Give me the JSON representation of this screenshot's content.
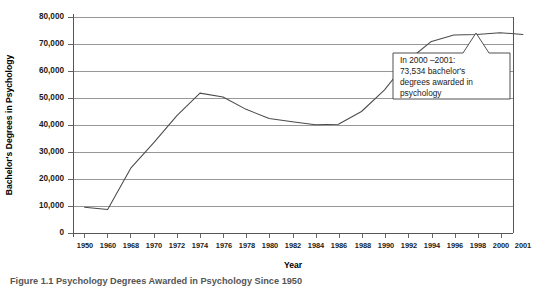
{
  "figure": {
    "caption_partial": "Figure 1.1  Psychology Degrees Awarded in Psychology Since 1950"
  },
  "chart_data": {
    "type": "line",
    "title": "",
    "xlabel": "Year",
    "ylabel": "Bachelor's Degrees in Psychology",
    "ylim": [
      0,
      80000
    ],
    "xlim": [
      1950,
      2001
    ],
    "grid": true,
    "legend": "none",
    "y_ticks": [
      0,
      10000,
      20000,
      30000,
      40000,
      50000,
      60000,
      70000,
      80000
    ],
    "y_tick_labels": [
      "0",
      "10,000",
      "20,000",
      "30,000",
      "40,000",
      "50,000",
      "60,000",
      "70,000",
      "80,000"
    ],
    "x_tick_labels": [
      "1950",
      "1960",
      "1968",
      "1970",
      "1972",
      "1974",
      "1976",
      "1978",
      "1980",
      "1982",
      "1984",
      "1986",
      "1988",
      "1990",
      "1992",
      "1994",
      "1996",
      "1998",
      "2000",
      "2001"
    ],
    "categories": [
      "1950",
      "1960",
      "1968",
      "1970",
      "1972",
      "1974",
      "1976",
      "1978",
      "1980",
      "1982",
      "1984",
      "1986",
      "1988",
      "1990",
      "1992",
      "1994",
      "1996",
      "1998",
      "2000",
      "2001"
    ],
    "values": [
      9500,
      8700,
      24000,
      33500,
      43500,
      51800,
      50400,
      45800,
      42400,
      41200,
      40100,
      40300,
      45000,
      53000,
      63800,
      70800,
      73300,
      73500,
      74200,
      73534
    ],
    "annotations": [
      {
        "name": "peak-2001-callout",
        "lines": [
          "In 2000 –2001:",
          "73,534 bachelor's",
          "degrees awarded in",
          "psychology"
        ],
        "points_to_year": "2001",
        "points_to_value": 73534
      }
    ],
    "colors": {
      "line": "#4a4a4a",
      "grid": "#8c8c8c",
      "axis": "#555555",
      "background": "#ffffff"
    }
  }
}
